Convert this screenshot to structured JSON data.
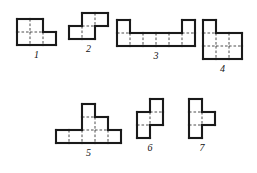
{
  "page": {
    "background_color": "#ffffff",
    "ink_color": "#1a1a1a",
    "grid_line_color": "#3a3a3a",
    "width": 257,
    "height": 173
  },
  "figures": [
    {
      "label": "1",
      "cell": 13,
      "cols": 3,
      "rows": 2,
      "cells": [
        [
          0,
          0
        ],
        [
          1,
          0
        ],
        [
          0,
          1
        ],
        [
          1,
          1
        ],
        [
          2,
          1
        ]
      ],
      "cell_count": 5,
      "x": 14,
      "y": 16
    },
    {
      "label": "2",
      "cell": 13,
      "cols": 3,
      "rows": 2,
      "cells": [
        [
          1,
          0
        ],
        [
          2,
          0
        ],
        [
          0,
          1
        ],
        [
          1,
          1
        ]
      ],
      "cell_count": 4,
      "x": 66,
      "y": 10
    },
    {
      "label": "3",
      "cell": 13,
      "cols": 6,
      "rows": 2,
      "cells": [
        [
          0,
          0
        ],
        [
          5,
          0
        ],
        [
          0,
          1
        ],
        [
          1,
          1
        ],
        [
          2,
          1
        ],
        [
          3,
          1
        ],
        [
          4,
          1
        ],
        [
          5,
          1
        ]
      ],
      "cell_count": 8,
      "x": 114,
      "y": 17
    },
    {
      "label": "4",
      "cell": 13,
      "cols": 3,
      "rows": 3,
      "cells": [
        [
          0,
          0
        ],
        [
          0,
          1
        ],
        [
          1,
          1
        ],
        [
          2,
          1
        ],
        [
          0,
          2
        ],
        [
          1,
          2
        ],
        [
          2,
          2
        ]
      ],
      "cell_count": 7,
      "x": 200,
      "y": 17
    },
    {
      "label": "5",
      "cell": 13,
      "cols": 5,
      "rows": 3,
      "cells": [
        [
          2,
          0
        ],
        [
          2,
          1
        ],
        [
          3,
          1
        ],
        [
          0,
          2
        ],
        [
          1,
          2
        ],
        [
          2,
          2
        ],
        [
          3,
          2
        ],
        [
          4,
          2
        ]
      ],
      "cell_count": 8,
      "x": 53,
      "y": 101
    },
    {
      "label": "6",
      "cell": 13,
      "cols": 2,
      "rows": 3,
      "cells": [
        [
          1,
          0
        ],
        [
          0,
          1
        ],
        [
          1,
          1
        ],
        [
          0,
          2
        ]
      ],
      "cell_count": 4,
      "x": 134,
      "y": 96
    },
    {
      "label": "7",
      "cell": 13,
      "cols": 2,
      "rows": 3,
      "cells": [
        [
          0,
          0
        ],
        [
          0,
          1
        ],
        [
          1,
          1
        ],
        [
          0,
          2
        ]
      ],
      "cell_count": 4,
      "x": 186,
      "y": 96
    }
  ]
}
